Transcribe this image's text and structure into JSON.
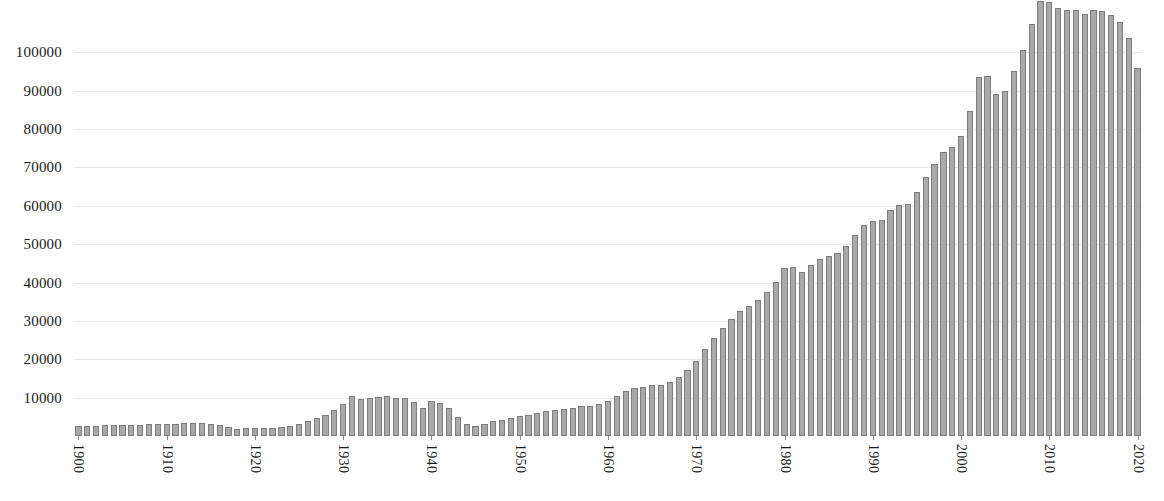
{
  "chart_data": {
    "type": "bar",
    "title": "",
    "subtitle": "",
    "xlabel": "",
    "ylabel": "",
    "grid": true,
    "legend": false,
    "legend_position": "none",
    "bar_color": "#a9a9a9",
    "bar_border_color": "#7d7d7d",
    "gridline_color": "#e6e6e6",
    "text_color": "#1a1a1a",
    "background_color": "#ffffff",
    "ylim": [
      0,
      113600
    ],
    "xlim": [
      1900,
      2020
    ],
    "ytick_values": [
      10000,
      20000,
      30000,
      40000,
      50000,
      60000,
      70000,
      80000,
      90000,
      100000
    ],
    "ytick_labels": [
      "10000",
      "20000",
      "30000",
      "40000",
      "50000",
      "60000",
      "70000",
      "80000",
      "90000",
      "100000"
    ],
    "xtick_values": [
      1900,
      1910,
      1920,
      1930,
      1940,
      1950,
      1960,
      1970,
      1980,
      1990,
      2000,
      2010,
      2020
    ],
    "xtick_labels": [
      "1900",
      "1910",
      "1920",
      "1930",
      "1940",
      "1950",
      "1960",
      "1970",
      "1980",
      "1990",
      "2000",
      "2010",
      "2020"
    ],
    "xtick_label_rotation": 90,
    "categories": [
      1900,
      1901,
      1902,
      1903,
      1904,
      1905,
      1906,
      1907,
      1908,
      1909,
      1910,
      1911,
      1912,
      1913,
      1914,
      1915,
      1916,
      1917,
      1918,
      1919,
      1920,
      1921,
      1922,
      1923,
      1924,
      1925,
      1926,
      1927,
      1928,
      1929,
      1930,
      1931,
      1932,
      1933,
      1934,
      1935,
      1936,
      1937,
      1938,
      1939,
      1940,
      1941,
      1942,
      1943,
      1944,
      1945,
      1946,
      1947,
      1948,
      1949,
      1950,
      1951,
      1952,
      1953,
      1954,
      1955,
      1956,
      1957,
      1958,
      1959,
      1960,
      1961,
      1962,
      1963,
      1964,
      1965,
      1966,
      1967,
      1968,
      1969,
      1970,
      1971,
      1972,
      1973,
      1974,
      1975,
      1976,
      1977,
      1978,
      1979,
      1980,
      1981,
      1982,
      1983,
      1984,
      1985,
      1986,
      1987,
      1988,
      1989,
      1990,
      1991,
      1992,
      1993,
      1994,
      1995,
      1996,
      1997,
      1998,
      1999,
      2000,
      2001,
      2002,
      2003,
      2004,
      2005,
      2006,
      2007,
      2008,
      2009,
      2010,
      2011,
      2012,
      2013,
      2014,
      2015,
      2016,
      2017,
      2018,
      2019,
      2020
    ],
    "values": [
      2600,
      2700,
      2700,
      2800,
      2900,
      2900,
      3000,
      3000,
      3100,
      3100,
      3200,
      3200,
      3300,
      3400,
      3300,
      3100,
      2900,
      2400,
      1900,
      2100,
      2200,
      2100,
      2200,
      2400,
      2700,
      3200,
      3800,
      4600,
      5600,
      6800,
      8300,
      10400,
      9600,
      9900,
      10200,
      10300,
      9900,
      10000,
      8800,
      7200,
      9100,
      8700,
      7400,
      5000,
      3100,
      2700,
      3200,
      3800,
      4200,
      4600,
      5100,
      5600,
      6000,
      6400,
      6700,
      7000,
      7300,
      7700,
      7900,
      8400,
      9200,
      10400,
      11600,
      12600,
      12800,
      13200,
      13300,
      14000,
      15400,
      17200,
      19600,
      22600,
      25600,
      28100,
      30600,
      32500,
      33900,
      35400,
      37600,
      40000,
      43700,
      44000,
      42800,
      44600,
      46200,
      47000,
      47800,
      49400,
      52500,
      54900,
      55900,
      56300,
      58900,
      60200,
      60500,
      63600,
      67400,
      71000,
      74000,
      75300,
      78100,
      84700,
      93500,
      93800,
      89200,
      90000,
      95200,
      100600,
      107400,
      113300,
      113200,
      111600,
      110900,
      111100,
      110000,
      111000,
      110700,
      109700,
      107800,
      103800,
      96000
    ],
    "last_value_label": "",
    "final_partial_bar": 65000
  }
}
